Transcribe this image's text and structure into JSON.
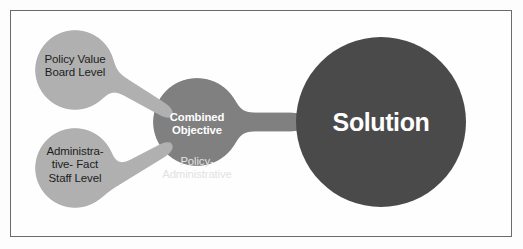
{
  "diagram": {
    "type": "metaball-flow-diagram",
    "colors": {
      "light_gray": "#b0b0b0",
      "medium_gray": "#808080",
      "dark_gray": "#4a4a4a",
      "background": "#fefefe",
      "border": "#6b6b6b",
      "text_dark": "#1d1d1d",
      "text_white": "#ffffff",
      "text_subtle": "#e2e2e2"
    },
    "nodes": {
      "policy": {
        "label": "Policy Value\nBoard Level",
        "fill": "#b0b0b0",
        "cx": 75,
        "cy": 70,
        "r": 40
      },
      "administrative": {
        "label": "Administra-\ntive- Fact\nStaff Level",
        "fill": "#b0b0b0",
        "cx": 75,
        "cy": 168,
        "r": 40
      },
      "combined": {
        "label_bold": "Combined\nObjective",
        "label_sub": "Policy-\nAdministrative",
        "fill": "#808080",
        "cx": 197,
        "cy": 122,
        "r": 44
      },
      "solution": {
        "label": "Solution",
        "fill": "#4a4a4a",
        "cx": 381,
        "cy": 122,
        "r": 85
      }
    },
    "connectors": [
      {
        "from": "policy",
        "to": "combined",
        "fill": "#b0b0b0"
      },
      {
        "from": "administrative",
        "to": "combined",
        "fill": "#b0b0b0"
      },
      {
        "from": "combined",
        "to": "solution",
        "fill": "#808080"
      }
    ]
  }
}
